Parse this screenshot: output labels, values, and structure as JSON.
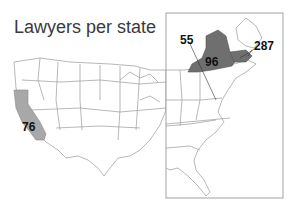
{
  "title": "Lawyers per state",
  "colors": {
    "background": "#ffffff",
    "state_border": "#9a9a9a",
    "california_fill": "#a8a8a8",
    "new_york_fill": "#6f6f6f",
    "massachusetts_fill": "#6f6f6f",
    "inset_frame": "#8a8a8a"
  },
  "labels": {
    "california": "76",
    "new_york": "96",
    "dc": "55",
    "massachusetts": "287"
  },
  "map": {
    "main": "Contiguous United States",
    "inset": "Northeast / East Coast detail"
  }
}
